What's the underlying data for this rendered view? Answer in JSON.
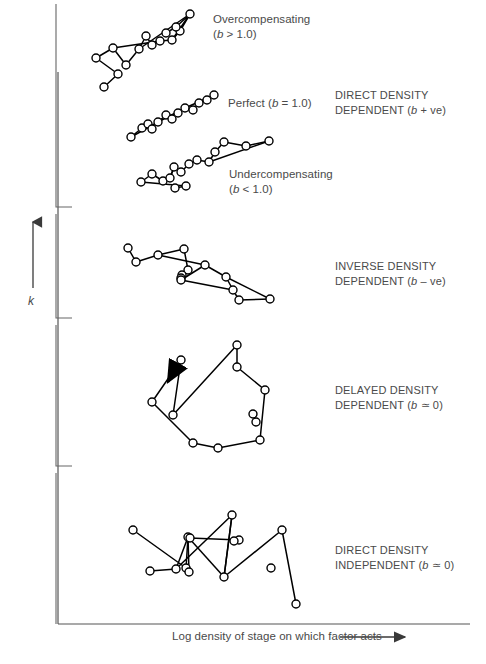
{
  "figure": {
    "background": "#ffffff",
    "ink": "#000000",
    "text_color": "#4a4a4a",
    "width": 486,
    "height": 664
  },
  "axes": {
    "y_label": "k",
    "y_arrow": "up-arrow",
    "x_label": "Log density of stage on which factor acts",
    "x_arrow": "right-arrow"
  },
  "plot_labels": [
    {
      "name": "overcompensating",
      "main": "Overcompensating",
      "sub_prefix": "(",
      "sub_var": "b",
      "sub_rest": " > 1.0)",
      "x": 213,
      "y": 12
    },
    {
      "name": "perfect",
      "main": "Perfect (",
      "sub_var": "b",
      "sub_rest": " = 1.0)",
      "x": 228,
      "y": 96
    },
    {
      "name": "undercompensating",
      "main": "Undercompensating",
      "sub_prefix": "(",
      "sub_var": "b",
      "sub_rest": " < 1.0)",
      "x": 229,
      "y": 167
    }
  ],
  "group_labels": [
    {
      "name": "direct-density-dependent",
      "line1": "DIRECT DENSITY",
      "line2_pre": "DEPENDENT (",
      "line2_var": "b",
      "line2_post": " + ve)",
      "x": 335,
      "y": 88
    },
    {
      "name": "inverse-density-dependent",
      "line1": "INVERSE DENSITY",
      "line2_pre": "DEPENDENT (",
      "line2_var": "b",
      "line2_post": " – ve)",
      "x": 335,
      "y": 259
    },
    {
      "name": "delayed-density-dependent",
      "line1": "DELAYED DENSITY",
      "line2_pre": "DEPENDENT (",
      "line2_var": "b",
      "line2_post": " ≃ 0)",
      "x": 335,
      "y": 383
    },
    {
      "name": "direct-density-independent",
      "line1": "DIRECT DENSITY",
      "line2_pre": "INDEPENDENT (",
      "line2_var": "b",
      "line2_post": " ≃ 0)",
      "x": 335,
      "y": 543
    }
  ],
  "caption": {
    "text": "",
    "visible": false
  },
  "chart_data": {
    "type": "scatter",
    "title": "",
    "xlabel": "Log density of stage on which factor acts",
    "ylabel": "k",
    "grid": false,
    "legend": "none",
    "note": "Schematic k-value versus log density plots illustrating five classes of density relationship. Each series is an open-circle point sequence joined by straight line segments in temporal order.",
    "series": [
      {
        "name": "Overcompensating (b > 1.0)",
        "group": "DIRECT DENSITY DEPENDENT (b + ve)",
        "marker": "open-circle",
        "slope_class": "steep positive",
        "points": [
          [
            104,
            87
          ],
          [
            118,
            74
          ],
          [
            96,
            58
          ],
          [
            113,
            48
          ],
          [
            126,
            65
          ],
          [
            139,
            49
          ],
          [
            146,
            36
          ],
          [
            152,
            45
          ],
          [
            160,
            41
          ],
          [
            172,
            40
          ],
          [
            180,
            31
          ],
          [
            190,
            14
          ],
          [
            176,
            27
          ],
          [
            166,
            33
          ]
        ],
        "path_order": [
          0,
          1,
          2,
          3,
          4,
          5,
          6,
          7,
          8,
          9,
          10,
          11,
          12,
          13
        ],
        "extra_edges": [
          [
            5,
            11
          ],
          [
            11,
            9
          ],
          [
            3,
            8
          ]
        ]
      },
      {
        "name": "Perfect (b = 1.0)",
        "group": "DIRECT DENSITY DEPENDENT (b + ve)",
        "marker": "open-circle",
        "slope_class": "unit positive",
        "points": [
          [
            131,
            137
          ],
          [
            142,
            128
          ],
          [
            148,
            124
          ],
          [
            152,
            129
          ],
          [
            158,
            122
          ],
          [
            166,
            115
          ],
          [
            172,
            119
          ],
          [
            178,
            113
          ],
          [
            185,
            108
          ],
          [
            193,
            110
          ],
          [
            199,
            103
          ],
          [
            207,
            100
          ],
          [
            214,
            95
          ]
        ],
        "path_order": [
          0,
          1,
          2,
          3,
          4,
          5,
          6,
          7,
          8,
          9,
          10,
          11,
          12
        ],
        "extra_edges": [
          [
            0,
            4
          ],
          [
            4,
            8
          ],
          [
            8,
            12
          ]
        ]
      },
      {
        "name": "Undercompensating (b < 1.0)",
        "group": "DIRECT DENSITY DEPENDENT (b + ve)",
        "marker": "open-circle",
        "slope_class": "shallow positive",
        "points": [
          [
            141,
            182
          ],
          [
            152,
            174
          ],
          [
            163,
            181
          ],
          [
            170,
            178
          ],
          [
            174,
            167
          ],
          [
            181,
            172
          ],
          [
            189,
            164
          ],
          [
            197,
            160
          ],
          [
            209,
            162
          ],
          [
            215,
            152
          ],
          [
            224,
            142
          ],
          [
            246,
            146
          ],
          [
            269,
            141
          ],
          [
            186,
            186
          ],
          [
            175,
            188
          ]
        ],
        "path_order": [
          14,
          13,
          0,
          1,
          2,
          3,
          4,
          5,
          6,
          7,
          8,
          9,
          10,
          11,
          12
        ],
        "extra_edges": [
          [
            8,
            12
          ],
          [
            4,
            3
          ]
        ]
      },
      {
        "name": "Inverse density dependent (b – ve)",
        "group": "INVERSE DENSITY DEPENDENT (b – ve)",
        "marker": "open-circle",
        "slope_class": "negative",
        "points": [
          [
            128,
            248
          ],
          [
            136,
            262
          ],
          [
            158,
            255
          ],
          [
            184,
            249
          ],
          [
            188,
            270
          ],
          [
            182,
            275
          ],
          [
            181,
            278
          ],
          [
            181,
            280
          ],
          [
            205,
            265
          ],
          [
            226,
            277
          ],
          [
            233,
            290
          ],
          [
            239,
            300
          ],
          [
            270,
            299
          ]
        ],
        "path_order": [
          0,
          1,
          2,
          3,
          4,
          5,
          6,
          7,
          8,
          9,
          10,
          11,
          12
        ],
        "extra_edges": [
          [
            2,
            8
          ],
          [
            7,
            10
          ],
          [
            9,
            12
          ]
        ]
      },
      {
        "name": "Delayed density dependent (b ≃ 0)",
        "group": "DELAYED DENSITY DEPENDENT (b ≃ 0)",
        "marker": "open-circle",
        "shape": "spiral-loop",
        "arrow": "direction-arrow",
        "points": [
          [
            181,
            360
          ],
          [
            237,
            367
          ],
          [
            173,
            415
          ],
          [
            237,
            345
          ],
          [
            265,
            390
          ],
          [
            253,
            414
          ],
          [
            260,
            440
          ],
          [
            218,
            448
          ],
          [
            152,
            402
          ],
          [
            193,
            443
          ],
          [
            256,
            422
          ]
        ],
        "path_order": [
          3,
          1,
          4,
          6,
          7,
          9,
          8,
          0,
          2
        ],
        "loop": true
      },
      {
        "name": "Direct density independent (b ≃ 0)",
        "group": "DIRECT DENSITY INDEPENDENT (b ≃ 0)",
        "marker": "open-circle",
        "slope_class": "none",
        "points": [
          [
            133,
            530
          ],
          [
            176,
            569
          ],
          [
            186,
            568
          ],
          [
            150,
            571
          ],
          [
            188,
            537
          ],
          [
            189,
            572
          ],
          [
            232,
            515
          ],
          [
            239,
            540
          ],
          [
            224,
            577
          ],
          [
            271,
            568
          ],
          [
            282,
            530
          ],
          [
            296,
            604
          ],
          [
            190,
            538
          ],
          [
            234,
            541
          ]
        ],
        "path_order": [
          0,
          2,
          4,
          1,
          6,
          8,
          10,
          11
        ],
        "extra_edges": [
          [
            3,
            1
          ],
          [
            4,
            5
          ],
          [
            12,
            7
          ],
          [
            6,
            8
          ],
          [
            4,
            8
          ]
        ]
      }
    ]
  }
}
